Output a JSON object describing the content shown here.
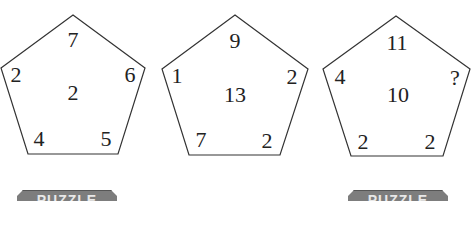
{
  "puzzle": {
    "pentagons": [
      {
        "top": "7",
        "left": "2",
        "right": "6",
        "center": "2",
        "bottom_left": "4",
        "bottom_right": "5"
      },
      {
        "top": "9",
        "left": "1",
        "right": "2",
        "center": "13",
        "bottom_left": "7",
        "bottom_right": "2"
      },
      {
        "top": "11",
        "left": "4",
        "right": "?",
        "center": "10",
        "bottom_left": "2",
        "bottom_right": "2"
      }
    ]
  },
  "badges": [
    {
      "label": "PUZZLE"
    },
    {
      "label": "PUZZLE"
    }
  ],
  "colors": {
    "line": "#333333",
    "badge": "#7d7d7d",
    "badge_text": "#e8e8e8"
  }
}
